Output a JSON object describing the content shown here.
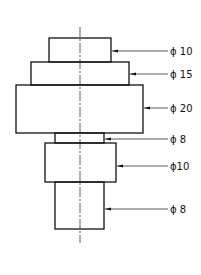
{
  "diagram": {
    "type": "stepped-shaft-drawing",
    "centerline": {
      "x": 80,
      "y1": 27,
      "y2": 243
    },
    "steps": [
      {
        "id": "step-1",
        "label": "ϕ 10",
        "x1": 49,
        "x2": 111,
        "y1": 38,
        "y2": 62,
        "leader_y": 51
      },
      {
        "id": "step-2",
        "label": "ϕ 15",
        "x1": 31,
        "x2": 129,
        "y1": 62,
        "y2": 85,
        "leader_y": 74
      },
      {
        "id": "step-3",
        "label": "ϕ 20",
        "x1": 16,
        "x2": 143,
        "y1": 85,
        "y2": 133,
        "leader_y": 108
      },
      {
        "id": "step-4",
        "label": "ϕ 8",
        "x1": 55,
        "x2": 104,
        "y1": 133,
        "y2": 143,
        "leader_y": 139
      },
      {
        "id": "step-5",
        "label": "ϕ10",
        "x1": 45,
        "x2": 116,
        "y1": 143,
        "y2": 182,
        "leader_y": 166
      },
      {
        "id": "step-6",
        "label": "ϕ 8",
        "x1": 55,
        "x2": 104,
        "y1": 182,
        "y2": 229,
        "leader_y": 209
      }
    ],
    "leader_end_x": 168,
    "label_x": 170,
    "colors": {
      "line": "#111111",
      "background": "#ffffff"
    }
  }
}
